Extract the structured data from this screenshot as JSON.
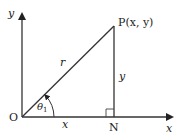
{
  "diagram": {
    "title": "",
    "type": "right-triangle-polar-coordinates",
    "colors": {
      "stroke": "#333333",
      "text": "#222222",
      "background": "#ffffff"
    },
    "axes": {
      "x_label": "x",
      "y_label": "y"
    },
    "points": {
      "origin": {
        "label": "O"
      },
      "P": {
        "label": "P(x, y)"
      },
      "N": {
        "label": "N"
      }
    },
    "segments": {
      "OP": {
        "label": "r"
      },
      "ON": {
        "label": "x"
      },
      "PN": {
        "label": "y"
      }
    },
    "angle": {
      "label_main": "θ",
      "label_sub": "1"
    },
    "right_angle_marker_at": "N"
  }
}
